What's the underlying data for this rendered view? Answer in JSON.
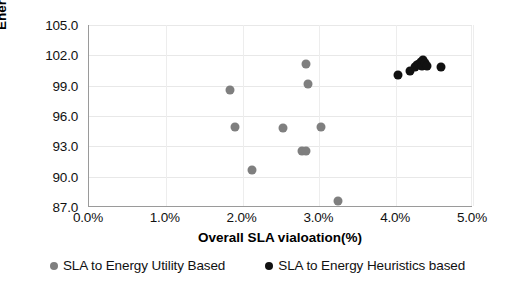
{
  "chart_data": {
    "type": "scatter",
    "title": "",
    "xlabel": "Overall SLA vialoation(%)",
    "ylabel": "Energy Consumption (KW)",
    "xlim": [
      0.0,
      5.0
    ],
    "ylim": [
      87.0,
      105.0
    ],
    "xticks": [
      "0.0%",
      "1.0%",
      "2.0%",
      "3.0%",
      "4.0%",
      "5.0%"
    ],
    "xtick_values": [
      0.0,
      1.0,
      2.0,
      3.0,
      4.0,
      5.0
    ],
    "yticks": [
      "87.0",
      "90.0",
      "93.0",
      "96.0",
      "99.0",
      "102.0",
      "105.0"
    ],
    "ytick_values": [
      87.0,
      90.0,
      93.0,
      96.0,
      99.0,
      102.0,
      105.0
    ],
    "grid": true,
    "legend_position": "bottom",
    "series": [
      {
        "name": "SLA to Energy Utility Based",
        "color": "#7f7f7f",
        "marker": "circle",
        "points": [
          {
            "x": 1.84,
            "y": 98.6
          },
          {
            "x": 1.9,
            "y": 94.9
          },
          {
            "x": 2.12,
            "y": 90.7
          },
          {
            "x": 2.52,
            "y": 94.8
          },
          {
            "x": 2.77,
            "y": 92.5
          },
          {
            "x": 2.83,
            "y": 92.5
          },
          {
            "x": 2.83,
            "y": 101.1
          },
          {
            "x": 2.85,
            "y": 99.2
          },
          {
            "x": 3.02,
            "y": 94.9
          },
          {
            "x": 3.24,
            "y": 87.6
          }
        ]
      },
      {
        "name": "SLA to Energy Heuristics based",
        "color": "#111111",
        "marker": "circle",
        "points": [
          {
            "x": 4.02,
            "y": 100.1
          },
          {
            "x": 4.18,
            "y": 100.5
          },
          {
            "x": 4.24,
            "y": 100.8
          },
          {
            "x": 4.27,
            "y": 101.0
          },
          {
            "x": 4.3,
            "y": 101.1
          },
          {
            "x": 4.32,
            "y": 101.3
          },
          {
            "x": 4.33,
            "y": 100.9
          },
          {
            "x": 4.35,
            "y": 101.5
          },
          {
            "x": 4.38,
            "y": 101.2
          },
          {
            "x": 4.4,
            "y": 100.9
          },
          {
            "x": 4.58,
            "y": 100.8
          }
        ]
      }
    ]
  },
  "legend": {
    "items": [
      {
        "label": "SLA to Energy Utility Based",
        "color": "#7f7f7f"
      },
      {
        "label": "SLA to Energy Heuristics based",
        "color": "#111111"
      }
    ]
  }
}
